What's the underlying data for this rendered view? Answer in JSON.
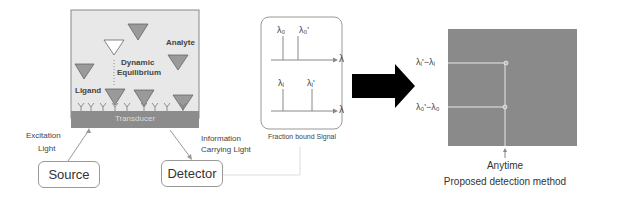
{
  "sensor": {
    "analyte_label": "Analyte",
    "equilibrium_label_1": "Dynamic",
    "equilibrium_label_2": "Equilibrium",
    "ligand_label": "Ligand",
    "transducer_label": "Transducer",
    "chamber_color": "#e8e8e8",
    "transducer_color": "#8c8c8c",
    "triangle_color": "#9a9a9a"
  },
  "source": {
    "label": "Source",
    "excitation_label_1": "Excitation",
    "excitation_label_2": "Light"
  },
  "detector": {
    "label": "Detector",
    "info_label_1": "Information",
    "info_label_2": "Carrying Light"
  },
  "spectra": {
    "caption": "Fraction bound Signal",
    "top": {
      "peak1": "λ₀",
      "peak2": "λ₀'",
      "axis": "λ"
    },
    "bottom": {
      "peak1": "λᵢ",
      "peak2": "λᵢ'",
      "axis": "λ"
    }
  },
  "arrow": {
    "color": "#000000"
  },
  "method": {
    "plot_color": "#8a8a8a",
    "y_label_top": "λᵢ'−λᵢ",
    "y_label_bottom": "λ₀'−λ₀",
    "time_label": "Anytime",
    "caption": "Proposed detection method"
  }
}
